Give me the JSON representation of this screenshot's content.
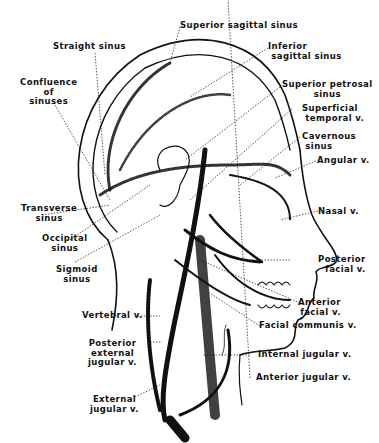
{
  "diagram": {
    "labels": {
      "superior_sagittal_sinus": "Superior sagittal sinus",
      "straight_sinus": "Straight sinus",
      "inferior_sagittal_sinus": "Inferior\n sagittal sinus",
      "confluence_of_sinuses": "Confluence\nof\nsinuses",
      "superior_petrosal_sinus": "Superior petrosal\nsinus",
      "superficial_temporal_v": "Superficial\n temporal v.",
      "cavernous_sinus": "Cavernous\n sinus",
      "angular_v": "Angular v.",
      "transverse_sinus": "Transverse\nsinus",
      "nasal_v": "Nasal v.",
      "occipital_sinus": "Occipital\nsinus",
      "sigmoid_sinus": "Sigmoid\nsinus",
      "posterior_facial_v": "Posterior\nfacial v.",
      "anterior_facial_v": "Anterior\nfacial v.",
      "vertebral_v": "Vertebral v.",
      "facial_communis_v": "Facial communis v.",
      "posterior_external_jugular_v": "Posterior\nexternal\njugular v.",
      "internal_jugular_v": "Internal jugular v.",
      "anterior_jugular_v": "Anterior jugular v.",
      "external_jugular_v": "External\njugular v."
    },
    "colors": {
      "ink": "#111111",
      "background": "#ffffff"
    }
  }
}
